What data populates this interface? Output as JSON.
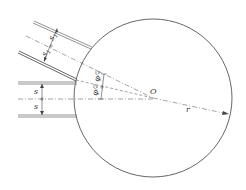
{
  "figure": {
    "labels": {
      "center": "O",
      "radius": "r",
      "width_inclined_a": "s",
      "width_inclined_a_sub": "1",
      "width_inclined_b": "s",
      "width_inclined_b_sub": "1",
      "width_horizontal_a": "s",
      "width_horizontal_b": "s",
      "angle_upper": "φ",
      "angle_upper_den": "2",
      "angle_lower": "φ",
      "angle_lower_den": "2"
    },
    "colors": {
      "line": "#555555",
      "wall": "#777777"
    }
  }
}
